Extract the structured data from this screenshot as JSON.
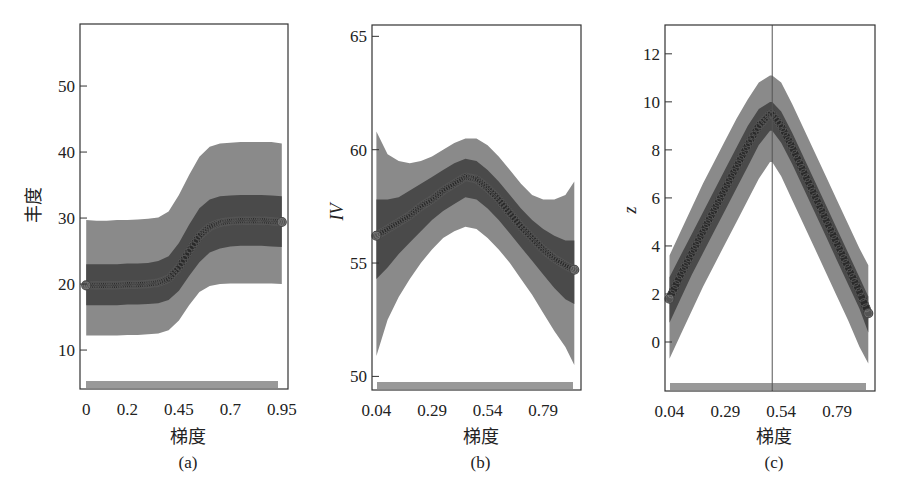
{
  "colors": {
    "outer_band": "#8a8a8a",
    "inner_band": "#4a4a4a",
    "mean_line": "#2a2a2a",
    "marker_edge": "#555555",
    "frame": "#333333",
    "rug": "#555555",
    "vline": "#555555"
  },
  "chart_data": [
    {
      "id": "a",
      "type": "line",
      "caption": "(a)",
      "title": "",
      "xlabel": "梯度",
      "ylabel": "丰度",
      "ylabel_italic": false,
      "xlim": [
        -0.03,
        0.98
      ],
      "ylim": [
        4.1,
        59.4
      ],
      "xticks": [
        0,
        0.2,
        0.45,
        0.7,
        0.95
      ],
      "xtick_labels": [
        "0",
        "0.2",
        "0.45",
        "0.7",
        "0.95"
      ],
      "yticks": [
        10,
        20,
        30,
        40,
        50
      ],
      "ytick_labels": [
        "10",
        "20",
        "30",
        "40",
        "50"
      ],
      "grid": false,
      "vline": null,
      "rug": true,
      "x": [
        0,
        0.05,
        0.1,
        0.15,
        0.2,
        0.25,
        0.3,
        0.35,
        0.4,
        0.45,
        0.5,
        0.55,
        0.6,
        0.65,
        0.7,
        0.75,
        0.8,
        0.85,
        0.9,
        0.95
      ],
      "series": [
        {
          "name": "mean",
          "values": [
            19.8,
            19.8,
            19.8,
            19.8,
            19.9,
            19.9,
            20.0,
            20.2,
            20.8,
            22.5,
            25.0,
            27.3,
            28.7,
            29.3,
            29.5,
            29.6,
            29.6,
            29.6,
            29.5,
            29.4
          ]
        },
        {
          "name": "inner_upper",
          "values": [
            23.0,
            23.0,
            23.0,
            23.0,
            23.1,
            23.1,
            23.2,
            23.5,
            24.2,
            26.2,
            29.0,
            31.5,
            32.8,
            33.3,
            33.4,
            33.5,
            33.5,
            33.5,
            33.4,
            33.3
          ]
        },
        {
          "name": "inner_lower",
          "values": [
            16.8,
            16.8,
            16.8,
            16.8,
            16.9,
            16.9,
            17.0,
            17.1,
            17.6,
            19.0,
            21.2,
            23.3,
            24.8,
            25.4,
            25.7,
            25.8,
            25.8,
            25.8,
            25.7,
            25.6
          ]
        },
        {
          "name": "outer_upper",
          "values": [
            29.7,
            29.6,
            29.6,
            29.7,
            29.7,
            29.8,
            29.9,
            30.1,
            31.0,
            33.5,
            36.5,
            39.3,
            40.8,
            41.3,
            41.4,
            41.5,
            41.5,
            41.5,
            41.5,
            41.3
          ]
        },
        {
          "name": "outer_lower",
          "values": [
            12.2,
            12.2,
            12.2,
            12.2,
            12.3,
            12.3,
            12.4,
            12.5,
            13.0,
            14.5,
            16.8,
            18.8,
            19.7,
            20.0,
            20.1,
            20.1,
            20.1,
            20.1,
            20.1,
            20.0
          ]
        }
      ]
    },
    {
      "id": "b",
      "type": "line",
      "caption": "(b)",
      "title": "",
      "xlabel": "梯度",
      "ylabel": "IV",
      "ylabel_italic": true,
      "xlim": [
        0.02,
        0.96
      ],
      "ylim": [
        49.4,
        65.5
      ],
      "xticks": [
        0.04,
        0.29,
        0.54,
        0.79
      ],
      "xtick_labels": [
        "0.04",
        "0.29",
        "0.54",
        "0.79"
      ],
      "yticks": [
        50,
        55,
        60,
        65
      ],
      "ytick_labels": [
        "50",
        "55",
        "60",
        "65"
      ],
      "grid": false,
      "vline": null,
      "rug": true,
      "x": [
        0.04,
        0.09,
        0.14,
        0.19,
        0.24,
        0.29,
        0.34,
        0.39,
        0.44,
        0.49,
        0.54,
        0.59,
        0.64,
        0.69,
        0.74,
        0.79,
        0.84,
        0.89,
        0.93
      ],
      "series": [
        {
          "name": "mean",
          "values": [
            56.2,
            56.5,
            56.8,
            57.1,
            57.5,
            57.8,
            58.2,
            58.5,
            58.8,
            58.7,
            58.3,
            57.8,
            57.2,
            56.6,
            56.1,
            55.6,
            55.2,
            54.9,
            54.7
          ]
        },
        {
          "name": "inner_upper",
          "values": [
            57.8,
            57.8,
            57.9,
            58.2,
            58.5,
            58.8,
            59.1,
            59.4,
            59.6,
            59.5,
            59.1,
            58.6,
            58.0,
            57.4,
            56.9,
            56.5,
            56.2,
            56.0,
            56.0
          ]
        },
        {
          "name": "inner_lower",
          "values": [
            54.3,
            54.8,
            55.4,
            55.9,
            56.4,
            56.9,
            57.3,
            57.6,
            57.9,
            57.8,
            57.4,
            56.9,
            56.3,
            55.7,
            55.1,
            54.5,
            53.9,
            53.4,
            53.2
          ]
        },
        {
          "name": "outer_upper",
          "values": [
            60.8,
            59.8,
            59.5,
            59.4,
            59.5,
            59.7,
            60.0,
            60.3,
            60.5,
            60.5,
            60.2,
            59.7,
            59.1,
            58.5,
            58.0,
            57.8,
            57.8,
            58.0,
            58.6
          ]
        },
        {
          "name": "outer_lower",
          "values": [
            50.9,
            52.5,
            53.5,
            54.3,
            55.0,
            55.6,
            56.1,
            56.4,
            56.6,
            56.5,
            56.1,
            55.6,
            55.0,
            54.3,
            53.6,
            52.8,
            52.0,
            51.3,
            50.5
          ]
        }
      ]
    },
    {
      "id": "c",
      "type": "line",
      "caption": "(c)",
      "title": "",
      "xlabel": "梯度",
      "ylabel": "z",
      "ylabel_italic": true,
      "xlim": [
        0.02,
        0.96
      ],
      "ylim": [
        -2.04,
        13.2
      ],
      "xticks": [
        0.04,
        0.29,
        0.54,
        0.79
      ],
      "xtick_labels": [
        "0.04",
        "0.29",
        "0.54",
        "0.79"
      ],
      "yticks": [
        0,
        2,
        4,
        6,
        8,
        10,
        12
      ],
      "ytick_labels": [
        "0",
        "2",
        "4",
        "6",
        "8",
        "10",
        "12"
      ],
      "grid": false,
      "vline": 0.5,
      "rug": true,
      "x": [
        0.04,
        0.09,
        0.14,
        0.19,
        0.24,
        0.29,
        0.34,
        0.39,
        0.44,
        0.49,
        0.5,
        0.54,
        0.59,
        0.64,
        0.69,
        0.74,
        0.79,
        0.84,
        0.89,
        0.93
      ],
      "series": [
        {
          "name": "mean",
          "values": [
            1.8,
            2.8,
            3.7,
            4.6,
            5.5,
            6.4,
            7.3,
            8.2,
            9.0,
            9.5,
            9.5,
            9.0,
            8.1,
            7.1,
            6.1,
            5.1,
            4.1,
            3.1,
            2.1,
            1.2
          ]
        },
        {
          "name": "inner_upper",
          "values": [
            2.7,
            3.6,
            4.5,
            5.4,
            6.3,
            7.2,
            8.1,
            9.0,
            9.7,
            10.0,
            10.0,
            9.6,
            8.7,
            7.7,
            6.7,
            5.7,
            4.7,
            3.7,
            2.7,
            1.9
          ]
        },
        {
          "name": "inner_lower",
          "values": [
            0.8,
            1.8,
            2.8,
            3.7,
            4.6,
            5.5,
            6.4,
            7.3,
            8.2,
            8.8,
            8.8,
            8.3,
            7.4,
            6.4,
            5.4,
            4.4,
            3.4,
            2.4,
            1.4,
            0.4
          ]
        },
        {
          "name": "outer_upper",
          "values": [
            3.6,
            4.6,
            5.6,
            6.6,
            7.5,
            8.4,
            9.3,
            10.1,
            10.8,
            11.1,
            11.1,
            10.8,
            9.9,
            8.9,
            7.9,
            6.9,
            5.9,
            4.9,
            3.9,
            3.2
          ]
        },
        {
          "name": "outer_lower",
          "values": [
            -0.7,
            0.3,
            1.3,
            2.3,
            3.2,
            4.1,
            5.0,
            5.9,
            6.8,
            7.5,
            7.5,
            6.9,
            5.9,
            4.9,
            3.9,
            2.9,
            1.9,
            0.9,
            -0.2,
            -0.9
          ]
        }
      ]
    }
  ],
  "panels_layout": [
    {
      "frame": {
        "x0": 80,
        "y0": 24,
        "x1": 288,
        "y1": 389
      },
      "ylabel_pos": {
        "x": 40,
        "y": 205
      },
      "caption_y": 468,
      "xlabel_y": 443,
      "data_x0": 87,
      "data_x1": 278
    },
    {
      "frame": {
        "x0": 372,
        "y0": 25,
        "x1": 581,
        "y1": 390
      },
      "ylabel_pos": {
        "x": 343,
        "y": 212
      },
      "caption_y": 468,
      "xlabel_y": 443,
      "data_x0": 378,
      "data_x1": 573
    },
    {
      "frame": {
        "x0": 665,
        "y0": 25,
        "x1": 875,
        "y1": 391
      },
      "ylabel_pos": {
        "x": 636,
        "y": 210
      },
      "caption_y": 468,
      "xlabel_y": 443,
      "data_x0": 671,
      "data_x1": 866
    }
  ]
}
